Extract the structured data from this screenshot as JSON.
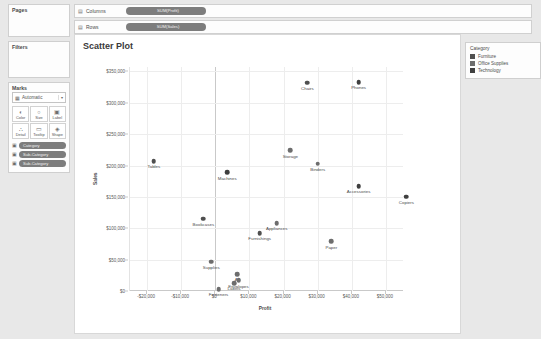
{
  "shelves": {
    "columns": {
      "label": "Columns",
      "icon": "grid-icon",
      "pill": "SUM(Profit)"
    },
    "rows": {
      "label": "Rows",
      "icon": "grid-icon",
      "pill": "SUM(Sales)"
    }
  },
  "rail": {
    "pages": {
      "title": "Pages"
    },
    "filters": {
      "title": "Filters"
    },
    "marks": {
      "title": "Marks",
      "type": "Automatic",
      "buttons": [
        {
          "name": "color",
          "label": "Color",
          "glyph": "◐"
        },
        {
          "name": "size",
          "label": "Size",
          "glyph": "○"
        },
        {
          "name": "label",
          "label": "Label",
          "glyph": "▣"
        },
        {
          "name": "detail",
          "label": "Detail",
          "glyph": "∴"
        },
        {
          "name": "tooltip",
          "label": "Tooltip",
          "glyph": "▭"
        },
        {
          "name": "shape",
          "label": "Shape",
          "glyph": "◈"
        }
      ],
      "pills": [
        {
          "icon": "color-icon",
          "text": "Category"
        },
        {
          "icon": "label-icon",
          "text": "Sub-Category"
        },
        {
          "icon": "detail-icon",
          "text": "Sub-Category"
        }
      ]
    }
  },
  "legend": {
    "title": "Category",
    "items": [
      {
        "label": "Furniture",
        "color": "#4f4f4f"
      },
      {
        "label": "Office Supplies",
        "color": "#6d6d6d"
      },
      {
        "label": "Technology",
        "color": "#3f3f3f"
      }
    ]
  },
  "chart_data": {
    "type": "scatter",
    "title": "Scatter Plot",
    "xlabel": "Profit",
    "ylabel": "Sales",
    "xlim": [
      -25000,
      55000
    ],
    "ylim": [
      0,
      357000
    ],
    "grid": true,
    "legend_position": "right",
    "xticks": [
      -20000,
      -10000,
      0,
      10000,
      20000,
      30000,
      40000,
      50000
    ],
    "xticklabels": [
      "-$20,000",
      "-$10,000",
      "$0",
      "$10,000",
      "$20,000",
      "$30,000",
      "$40,000",
      "$50,000"
    ],
    "yticks": [
      0,
      50000,
      100000,
      150000,
      200000,
      250000,
      300000,
      350000
    ],
    "yticklabels": [
      "$0",
      "$50,000",
      "$100,000",
      "$150,000",
      "$200,000",
      "$250,000",
      "$300,000",
      "$350,000"
    ],
    "points": [
      {
        "label": "Chairs",
        "x": 27000,
        "y": 332000,
        "category": "Furniture",
        "color": "#4f4f4f"
      },
      {
        "label": "Phones",
        "x": 42000,
        "y": 333000,
        "category": "Technology",
        "color": "#3f3f3f"
      },
      {
        "label": "Storage",
        "x": 22000,
        "y": 224000,
        "category": "Office Supplies",
        "color": "#6d6d6d"
      },
      {
        "label": "Binders",
        "x": 30000,
        "y": 203000,
        "category": "Office Supplies",
        "color": "#6d6d6d"
      },
      {
        "label": "Tables",
        "x": -18000,
        "y": 207000,
        "category": "Furniture",
        "color": "#4f4f4f"
      },
      {
        "label": "Machines",
        "x": 3500,
        "y": 189000,
        "category": "Technology",
        "color": "#3f3f3f"
      },
      {
        "label": "Accessories",
        "x": 42000,
        "y": 167000,
        "category": "Technology",
        "color": "#3f3f3f"
      },
      {
        "label": "Copiers",
        "x": 56000,
        "y": 150000,
        "category": "Technology",
        "color": "#3f3f3f"
      },
      {
        "label": "Bookcases",
        "x": -3500,
        "y": 115000,
        "category": "Furniture",
        "color": "#4f4f4f"
      },
      {
        "label": "Appliances",
        "x": 18000,
        "y": 108000,
        "category": "Office Supplies",
        "color": "#6d6d6d"
      },
      {
        "label": "Furnishings",
        "x": 13000,
        "y": 92000,
        "category": "Furniture",
        "color": "#4f4f4f"
      },
      {
        "label": "Paper",
        "x": 34000,
        "y": 79000,
        "category": "Office Supplies",
        "color": "#6d6d6d"
      },
      {
        "label": "Supplies",
        "x": -1200,
        "y": 47000,
        "category": "Office Supplies",
        "color": "#6d6d6d"
      },
      {
        "label": "Art",
        "x": 6500,
        "y": 27000,
        "category": "Office Supplies",
        "color": "#6d6d6d"
      },
      {
        "label": "Envelopes",
        "x": 6800,
        "y": 17000,
        "category": "Office Supplies",
        "color": "#6d6d6d"
      },
      {
        "label": "Labels",
        "x": 5500,
        "y": 12500,
        "category": "Office Supplies",
        "color": "#6d6d6d"
      },
      {
        "label": "Fasteners",
        "x": 950,
        "y": 3000,
        "category": "Office Supplies",
        "color": "#6d6d6d"
      }
    ]
  }
}
